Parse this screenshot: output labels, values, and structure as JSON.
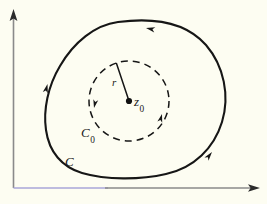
{
  "figure": {
    "background_color": "#fdfdf2",
    "curve_color": "#161616",
    "axis_color": "#8a8a8a",
    "axis_tint_color": "#a9a6d8",
    "labels": {
      "center_point": "z",
      "center_point_sub": "0",
      "radius": "r",
      "inner_circle": "C",
      "inner_circle_sub": "0",
      "outer_contour": "C"
    },
    "axes": {
      "origin": [
        13,
        188
      ],
      "y_axis_tip": [
        13,
        10
      ],
      "x_axis_tip": [
        258,
        188
      ],
      "x_tint_end": 108
    },
    "inner_circle": {
      "center": [
        129,
        101
      ],
      "radius": 40,
      "style": "dashed",
      "orientation": "counterclockwise",
      "radius_line_end": [
        115,
        63
      ],
      "arrow_positions_deg": [
        196,
        330
      ]
    },
    "outer_contour": {
      "style": "solid",
      "orientation": "counterclockwise",
      "path": "M 118 22 C 95 25 74 42 60 66 C 48 86 43 110 46 130 C 49 152 62 167 82 173 C 106 180 140 180 166 174 C 194 168 214 148 222 122 C 230 96 224 66 206 45 C 184 20 148 18 118 22 Z",
      "arrow_positions": [
        {
          "at": [
            143,
            27
          ],
          "dir_deg": 190
        },
        {
          "at": [
            47,
            86
          ],
          "dir_deg": 280
        },
        {
          "at": [
            210,
            155
          ],
          "dir_deg": 35
        }
      ]
    },
    "icon_names": [
      "y-axis-arrow-icon",
      "x-axis-arrow-icon",
      "center-dot-icon",
      "direction-arrow-icon"
    ]
  }
}
